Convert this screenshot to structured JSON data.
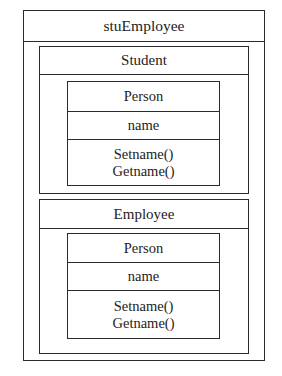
{
  "diagram": {
    "type": "nested-class-structure",
    "outer": {
      "name": "stuEmployee",
      "children": [
        {
          "name": "Student",
          "member_class": {
            "name": "Person",
            "attributes": [
              "name"
            ],
            "methods": [
              "Setname()",
              "Getname()"
            ]
          }
        },
        {
          "name": "Employee",
          "member_class": {
            "name": "Person",
            "attributes": [
              "name"
            ],
            "methods": [
              "Setname()",
              "Getname()"
            ]
          }
        }
      ]
    },
    "colors": {
      "line": "#2a2a2a",
      "background": "#ffffff",
      "text": "#222222"
    }
  }
}
